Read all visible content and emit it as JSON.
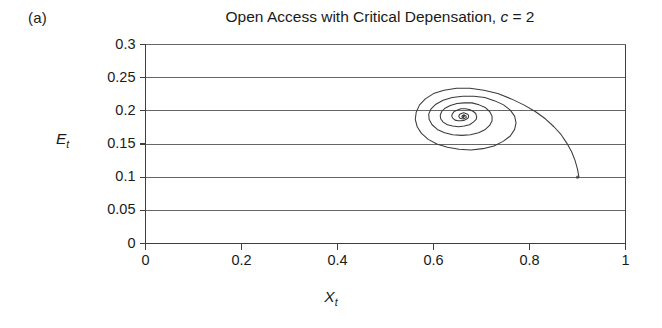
{
  "figure": {
    "panel_label": "(a)"
  },
  "chart_data": {
    "type": "line",
    "title": "Open Access with Critical Depensation, c = 2",
    "title_prefix": "Open Access with Critical Depensation, ",
    "title_param_symbol": "c",
    "title_param_value": " = 2",
    "xlabel": "X",
    "xlabel_sub": "t",
    "ylabel": "E",
    "ylabel_sub": "t",
    "xlim": [
      0,
      1
    ],
    "ylim": [
      0,
      0.3
    ],
    "grid": "horizontal",
    "legend": "none",
    "xticks": [
      0,
      0.2,
      0.4,
      0.6,
      0.8,
      1
    ],
    "xtick_labels": [
      "0",
      "0.2",
      "0.4",
      "0.6",
      "0.8",
      "1"
    ],
    "yticks": [
      0,
      0.05,
      0.1,
      0.15,
      0.2,
      0.25,
      0.3
    ],
    "ytick_labels": [
      "0",
      "0.05",
      "0.1",
      "0.15",
      "0.2",
      "0.25",
      "0.3"
    ],
    "series": [
      {
        "name": "phase-trajectory",
        "color": "#3a3a3a",
        "start_point": [
          0.9,
          0.1
        ],
        "focus_point": [
          0.665,
          0.19
        ],
        "description": "inward spiral converging to interior equilibrium",
        "points": [
          [
            0.903,
            0.1
          ],
          [
            0.9,
            0.112
          ],
          [
            0.895,
            0.125
          ],
          [
            0.888,
            0.138
          ],
          [
            0.878,
            0.151
          ],
          [
            0.866,
            0.164
          ],
          [
            0.851,
            0.176
          ],
          [
            0.833,
            0.188
          ],
          [
            0.812,
            0.199
          ],
          [
            0.788,
            0.209
          ],
          [
            0.762,
            0.218
          ],
          [
            0.734,
            0.226
          ],
          [
            0.705,
            0.231
          ],
          [
            0.676,
            0.234
          ],
          [
            0.648,
            0.234
          ],
          [
            0.622,
            0.231
          ],
          [
            0.6,
            0.226
          ],
          [
            0.583,
            0.218
          ],
          [
            0.571,
            0.209
          ],
          [
            0.564,
            0.198
          ],
          [
            0.562,
            0.187
          ],
          [
            0.566,
            0.176
          ],
          [
            0.575,
            0.166
          ],
          [
            0.589,
            0.157
          ],
          [
            0.607,
            0.15
          ],
          [
            0.629,
            0.145
          ],
          [
            0.653,
            0.142
          ],
          [
            0.678,
            0.141
          ],
          [
            0.703,
            0.143
          ],
          [
            0.726,
            0.147
          ],
          [
            0.745,
            0.154
          ],
          [
            0.76,
            0.162
          ],
          [
            0.769,
            0.172
          ],
          [
            0.772,
            0.182
          ],
          [
            0.769,
            0.192
          ],
          [
            0.76,
            0.201
          ],
          [
            0.746,
            0.209
          ],
          [
            0.728,
            0.215
          ],
          [
            0.707,
            0.22
          ],
          [
            0.684,
            0.222
          ],
          [
            0.661,
            0.222
          ],
          [
            0.639,
            0.22
          ],
          [
            0.62,
            0.216
          ],
          [
            0.605,
            0.21
          ],
          [
            0.595,
            0.203
          ],
          [
            0.59,
            0.195
          ],
          [
            0.591,
            0.187
          ],
          [
            0.597,
            0.179
          ],
          [
            0.608,
            0.172
          ],
          [
            0.623,
            0.167
          ],
          [
            0.64,
            0.164
          ],
          [
            0.659,
            0.163
          ],
          [
            0.677,
            0.164
          ],
          [
            0.694,
            0.167
          ],
          [
            0.708,
            0.172
          ],
          [
            0.717,
            0.178
          ],
          [
            0.722,
            0.185
          ],
          [
            0.722,
            0.192
          ],
          [
            0.717,
            0.199
          ],
          [
            0.708,
            0.205
          ],
          [
            0.695,
            0.209
          ],
          [
            0.68,
            0.212
          ],
          [
            0.664,
            0.212
          ],
          [
            0.649,
            0.211
          ],
          [
            0.635,
            0.208
          ],
          [
            0.624,
            0.204
          ],
          [
            0.617,
            0.199
          ],
          [
            0.614,
            0.193
          ],
          [
            0.615,
            0.188
          ],
          [
            0.62,
            0.183
          ],
          [
            0.629,
            0.179
          ],
          [
            0.64,
            0.177
          ],
          [
            0.652,
            0.176
          ],
          [
            0.664,
            0.177
          ],
          [
            0.675,
            0.179
          ],
          [
            0.683,
            0.183
          ],
          [
            0.689,
            0.187
          ],
          [
            0.69,
            0.191
          ],
          [
            0.688,
            0.196
          ],
          [
            0.683,
            0.199
          ],
          [
            0.675,
            0.202
          ],
          [
            0.666,
            0.203
          ],
          [
            0.657,
            0.203
          ],
          [
            0.649,
            0.201
          ],
          [
            0.643,
            0.199
          ],
          [
            0.639,
            0.195
          ],
          [
            0.638,
            0.192
          ],
          [
            0.64,
            0.189
          ],
          [
            0.645,
            0.186
          ],
          [
            0.651,
            0.185
          ],
          [
            0.658,
            0.185
          ],
          [
            0.665,
            0.186
          ],
          [
            0.67,
            0.188
          ],
          [
            0.673,
            0.19
          ],
          [
            0.673,
            0.193
          ],
          [
            0.671,
            0.195
          ],
          [
            0.667,
            0.196
          ],
          [
            0.663,
            0.197
          ],
          [
            0.658,
            0.196
          ],
          [
            0.655,
            0.195
          ],
          [
            0.653,
            0.193
          ],
          [
            0.653,
            0.191
          ],
          [
            0.655,
            0.189
          ],
          [
            0.659,
            0.188
          ],
          [
            0.663,
            0.188
          ],
          [
            0.666,
            0.189
          ],
          [
            0.668,
            0.19
          ],
          [
            0.668,
            0.192
          ],
          [
            0.666,
            0.193
          ],
          [
            0.663,
            0.194
          ],
          [
            0.661,
            0.193
          ],
          [
            0.659,
            0.192
          ],
          [
            0.66,
            0.19
          ],
          [
            0.662,
            0.19
          ],
          [
            0.664,
            0.191
          ],
          [
            0.664,
            0.192
          ],
          [
            0.663,
            0.192
          ],
          [
            0.662,
            0.191
          ],
          [
            0.663,
            0.191
          ]
        ]
      }
    ],
    "colors": {
      "axis": "#3f3f3f",
      "grid": "#555555",
      "curve": "#3a3a3a",
      "background": "#ffffff"
    }
  }
}
